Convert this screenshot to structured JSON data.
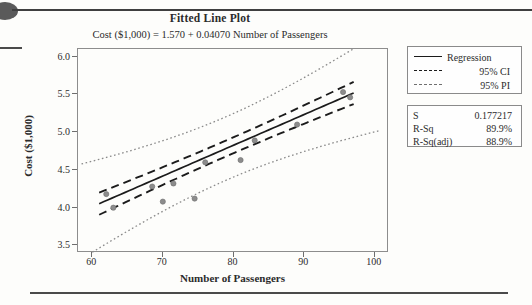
{
  "chart_data": {
    "type": "scatter",
    "title": "Fitted Line Plot",
    "subtitle": "Cost ($1,000) = 1.570 + 0.04070 Number of Passengers",
    "xlabel": "Number of Passengers",
    "ylabel": "Cost ($1,000)",
    "xlim": [
      58,
      102
    ],
    "ylim": [
      3.4,
      6.1
    ],
    "xticks": [
      "60",
      "70",
      "80",
      "90",
      "100"
    ],
    "xtick_values": [
      60,
      70,
      80,
      90,
      100
    ],
    "yticks": [
      "3.5",
      "4.0",
      "4.5",
      "5.0",
      "5.5",
      "6.0"
    ],
    "ytick_values": [
      3.5,
      4.0,
      4.5,
      5.0,
      5.5,
      6.0
    ],
    "grid": false,
    "legend_position": "right",
    "intercept": 1.57,
    "slope": 0.0407,
    "fit_x_range": [
      61,
      97
    ],
    "points": [
      {
        "x": 62.0,
        "y": 4.18
      },
      {
        "x": 63.0,
        "y": 4.0
      },
      {
        "x": 68.5,
        "y": 4.28
      },
      {
        "x": 70.0,
        "y": 4.08
      },
      {
        "x": 71.5,
        "y": 4.32
      },
      {
        "x": 74.5,
        "y": 4.12
      },
      {
        "x": 76.0,
        "y": 4.6
      },
      {
        "x": 81.0,
        "y": 4.63
      },
      {
        "x": 83.0,
        "y": 4.89
      },
      {
        "x": 89.0,
        "y": 5.1
      },
      {
        "x": 95.5,
        "y": 5.53
      },
      {
        "x": 96.5,
        "y": 5.46
      }
    ],
    "ci_half_width": 0.105,
    "pi_half_width": 0.42,
    "series": [
      {
        "name": "Regression",
        "style": "solid",
        "color": "#1b1b1b"
      },
      {
        "name": "95% CI",
        "style": "dashed",
        "color": "#1b1b1b"
      },
      {
        "name": "95% PI",
        "style": "dotted",
        "color": "#7a7a7a"
      }
    ]
  },
  "legend": {
    "items": [
      {
        "label": "Regression",
        "key": "solid-line-key"
      },
      {
        "label": "95% CI",
        "key": "dashed-line-key"
      },
      {
        "label": "95% PI",
        "key": "dotted-line-key"
      }
    ]
  },
  "stats": {
    "rows": [
      {
        "name": "S",
        "value": "0.177217"
      },
      {
        "name": "R-Sq",
        "value": "89.9%"
      },
      {
        "name": "R-Sq(adj)",
        "value": "88.9%"
      }
    ]
  },
  "colors": {
    "point": "#8c8c8c",
    "regression": "#1b1b1b",
    "ci": "#1b1b1b",
    "pi": "#8a8a8a",
    "frame": "#8d8d8d",
    "text": "#2b2b2b"
  }
}
